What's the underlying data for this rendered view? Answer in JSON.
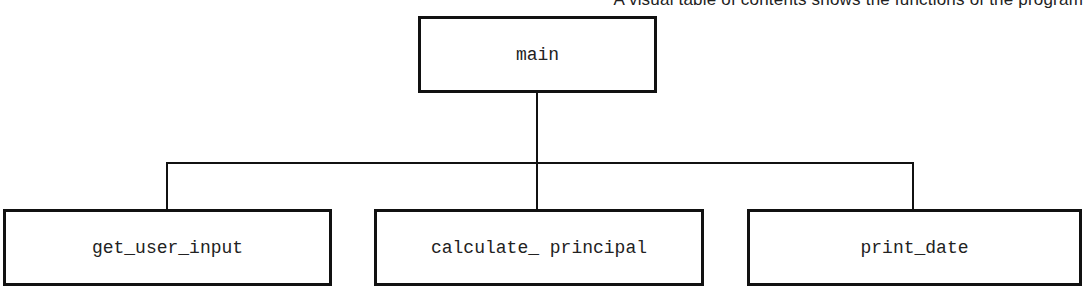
{
  "caption": "A visual table of contents shows the functions of the program",
  "diagram": {
    "type": "hierarchy-chart",
    "root": {
      "label": "main"
    },
    "children": [
      {
        "label": "get_user_input"
      },
      {
        "label": "calculate_ principal"
      },
      {
        "label": "print_date"
      }
    ],
    "colors": {
      "stroke": "#111111",
      "text": "#222222",
      "background": "#ffffff"
    }
  }
}
